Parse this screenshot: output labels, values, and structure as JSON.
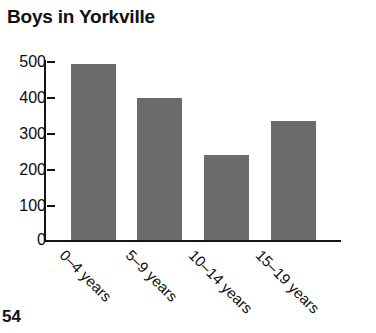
{
  "page": {
    "number": "54",
    "background": "#ffffff"
  },
  "chart_data": {
    "type": "bar",
    "title": "Boys in Yorkville",
    "xlabel": "",
    "ylabel": "",
    "categories": [
      "0–4 years",
      "5–9 years",
      "10–14 years",
      "15–19 years"
    ],
    "values": [
      495,
      398,
      239,
      333
    ],
    "ylim": [
      0,
      500
    ],
    "yticks": [
      0,
      100,
      200,
      300,
      400,
      500
    ],
    "ytick_labels": [
      "0",
      "100",
      "200",
      "300",
      "400",
      "500"
    ],
    "grid": false,
    "legend": null,
    "bar_color": "#6b6b6b",
    "axis_color": "#141414",
    "xtick_rotation": 45
  }
}
